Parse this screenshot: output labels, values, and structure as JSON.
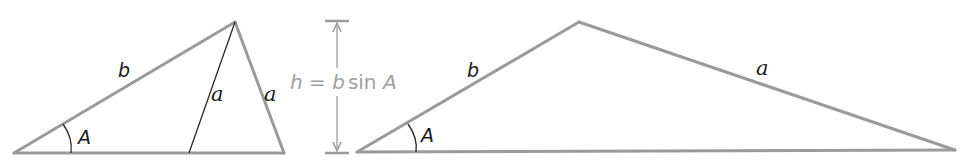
{
  "diagram": {
    "type": "ambiguous-case-SSA-triangles",
    "colors": {
      "edge": "#9a9a9a",
      "inner_segment": "#2a2a2a",
      "label": "#1a1a1a",
      "formula": "#a0a0a0"
    },
    "left_figure": {
      "side_b_label": "b",
      "inner_side_a_label": "a",
      "outer_side_a_label": "a",
      "angle_label": "A"
    },
    "height_indicator": {
      "formula_h": "h",
      "formula_eq": " = ",
      "formula_b": "b",
      "formula_sin": "sin ",
      "formula_A": "A"
    },
    "right_figure": {
      "side_b_label": "b",
      "side_a_label": "a",
      "angle_label": "A"
    }
  }
}
